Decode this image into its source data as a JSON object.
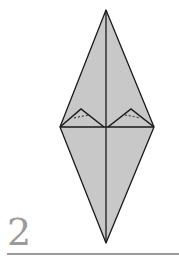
{
  "step": {
    "number": "2"
  },
  "colors": {
    "fill": "#c8c8c8",
    "stroke": "#1a1a1a",
    "label": "#9a9a9a"
  }
}
